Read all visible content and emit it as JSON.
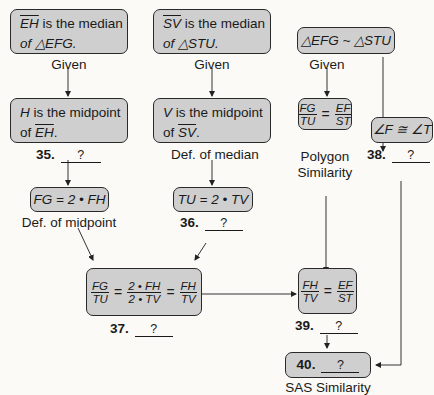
{
  "diagram": {
    "type": "flow-proof",
    "nodes": {
      "given1": {
        "seg": "EH",
        "text": " is the median",
        "line2": "of △EFG.",
        "reason": "Given"
      },
      "given2": {
        "seg": "SV",
        "text": " is the median",
        "line2": "of △STU.",
        "reason": "Given"
      },
      "given3": {
        "text": "△EFG ~ △STU",
        "reason": "Given"
      },
      "mid1": {
        "var": "H",
        "text": " is the midpoint",
        "line2_pre": "of ",
        "seg": "EH",
        "line2_post": ".",
        "reason_num": "35.",
        "reason_blank": "?"
      },
      "mid2": {
        "var": "V",
        "text": " is the midpoint",
        "line2_pre": "of ",
        "seg": "SV",
        "line2_post": ".",
        "reason": "Def. of median"
      },
      "ratio1": {
        "num1": "FG",
        "den1": "TU",
        "eq": "=",
        "num2": "EF",
        "den2": "ST",
        "reason_line1": "Polygon",
        "reason_line2": "Similarity"
      },
      "angle": {
        "text": "∠F ≅ ∠T",
        "reason_num": "38.",
        "reason_blank": "?"
      },
      "eq1": {
        "text": "FG = 2 • FH",
        "reason": "Def. of midpoint"
      },
      "eq2": {
        "text": "TU = 2 • TV",
        "reason_num": "36.",
        "reason_blank": "?"
      },
      "ratio2": {
        "a_num": "FG",
        "a_den": "TU",
        "b_num": "2 • FH",
        "b_den": "2 • TV",
        "c_num": "FH",
        "c_den": "TV",
        "eq": "=",
        "reason_num": "37.",
        "reason_blank": "?"
      },
      "ratio3": {
        "num1": "FH",
        "den1": "TV",
        "eq": "=",
        "num2": "EF",
        "den2": "ST",
        "reason_num": "39.",
        "reason_blank": "?"
      },
      "final": {
        "num": "40.",
        "blank": "?",
        "reason": "SAS Similarity"
      }
    }
  }
}
